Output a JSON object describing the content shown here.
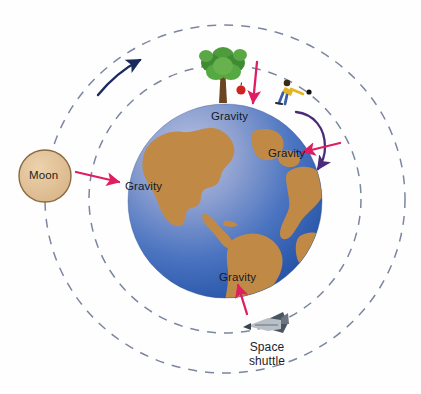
{
  "figure": {
    "background_color": "#fefefe"
  },
  "earth": {
    "name": "Earth",
    "ocean_color_light": "#9fb0d8",
    "ocean_color_deep": "#2a5cb0",
    "land_color": "#c08a46",
    "center": {
      "x": 225,
      "y": 201
    },
    "radius": 97
  },
  "moon": {
    "label": "Moon",
    "fill_color": "#e0bf95",
    "stroke_color": "#8a6a3f",
    "center": {
      "x": 45,
      "y": 176
    },
    "radius": 26
  },
  "orbits": [
    {
      "name": "inner-orbit",
      "radius_x": 136,
      "radius_y": 136,
      "dash_color": "#7b86a0"
    },
    {
      "name": "outer-orbit",
      "radius_x": 180,
      "radius_y": 175,
      "dash_color": "#7b86a0"
    }
  ],
  "orbit_direction": {
    "name": "moon-orbit-direction-arrow",
    "color": "#1b2a5e",
    "description": "counterclockwise arrow along moon orbit"
  },
  "gravity_arrows": {
    "color": "#e11d62",
    "items": [
      {
        "name": "gravity-arrow-moon",
        "label": "Gravity",
        "direction": "right",
        "label_x": 125,
        "label_y": 179
      },
      {
        "name": "gravity-arrow-apple",
        "label": "Gravity",
        "direction": "down",
        "label_x": 211,
        "label_y": 111
      },
      {
        "name": "gravity-arrow-ball",
        "label": "Gravity",
        "direction": "left",
        "label_x": 268,
        "label_y": 148
      },
      {
        "name": "gravity-arrow-shuttle",
        "label": "Gravity",
        "direction": "up",
        "label_x": 219,
        "label_y": 272
      }
    ]
  },
  "objects": {
    "tree": {
      "name": "tree",
      "foliage_color": "#4e9b3c",
      "trunk_color": "#6b4423"
    },
    "apple": {
      "name": "falling-apple",
      "color": "#cf2222"
    },
    "person": {
      "name": "person-throwing-ball",
      "shirt_color": "#e3b521",
      "pants_color": "#3a5ea8"
    },
    "ball": {
      "name": "thrown-ball",
      "color": "#111111"
    },
    "ball_path": {
      "name": "ball-trajectory-arrow",
      "color": "#4b2a7a"
    },
    "shuttle": {
      "name": "space-shuttle",
      "label": "Space shuttle",
      "body_color": "#b9bfc7",
      "wing_color": "#4a5562"
    }
  },
  "labels": {
    "gravity": "Gravity",
    "moon": "Moon",
    "space_shuttle_line1": "Space",
    "space_shuttle_line2": "shuttle"
  }
}
